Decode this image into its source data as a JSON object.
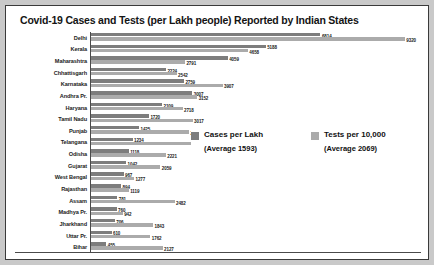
{
  "chart_data": {
    "type": "bar",
    "title": "Covid-19 Cases and Tests (per Lakh people) Reported by Indian States",
    "orientation": "horizontal",
    "grouped": true,
    "xlabel": "",
    "ylabel": "",
    "xlim": [
      0,
      9800
    ],
    "grid": false,
    "legend_position": "center-right",
    "categories": [
      "Delhi",
      "Kerala",
      "Maharashtra",
      "Chhattisgarh",
      "Karnataka",
      "Andhra Pr.",
      "Haryana",
      "Tamil Nadu",
      "Punjab",
      "Telangana",
      "Odisha",
      "Gujarat",
      "West Bengal",
      "Rajasthan",
      "Assam",
      "Madhya Pr.",
      "Jharkhand",
      "Uttar Pr.",
      "Bihar"
    ],
    "series": [
      {
        "name": "Cases per Lakh",
        "color": "#7d7d7d",
        "average": 1593,
        "values": [
          6814,
          5188,
          4059,
          2224,
          2759,
          3007,
          2109,
          1720,
          1425,
          1234,
          1118,
          1042,
          967,
          894,
          781,
          760,
          706,
          610,
          455
        ]
      },
      {
        "name": "Tests per 10,000",
        "color": "#ababab",
        "average": 2069,
        "values": [
          9320,
          4658,
          2791,
          2542,
          3907,
          3152,
          2718,
          3017,
          2911,
          3364,
          2221,
          2059,
          1277,
          1119,
          2482,
          942,
          1843,
          1762,
          2127
        ]
      }
    ]
  },
  "legend": {
    "items": [
      {
        "label": "Cases per Lakh",
        "sub": "(Average 1593)",
        "color": "#7d7d7d"
      },
      {
        "label": "Tests per 10,000",
        "sub": "(Average 2069)",
        "color": "#ababab"
      }
    ]
  }
}
